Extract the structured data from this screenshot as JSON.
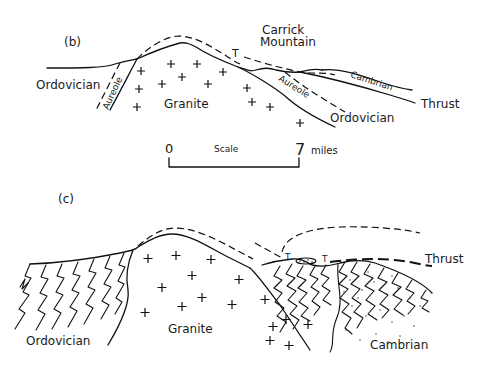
{
  "panel_b": {
    "label": "(b)",
    "mountain_label_line1": "Carrick",
    "mountain_label_line2": "Mountain",
    "fault_marker": "T",
    "units": {
      "ordovician_left": "Ordovician",
      "aureole_left": "Aureole",
      "granite": "Granite",
      "aureole_right": "Aureole",
      "cambrian": "Cambrian",
      "ordovician_right": "Ordovician",
      "thrust": "Thrust"
    },
    "scale": {
      "start": "0",
      "label": "Scale",
      "end": "7",
      "unit": "miles"
    }
  },
  "panel_c": {
    "label": "(c)",
    "fault_marker_1": "T",
    "fault_marker_2": "T",
    "units": {
      "ordovician": "Ordovician",
      "granite": "Granite",
      "cambrian": "Cambrian",
      "thrust": "Thrust"
    }
  }
}
